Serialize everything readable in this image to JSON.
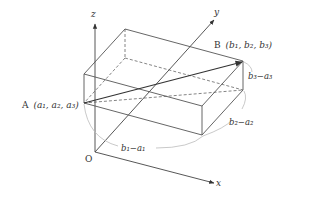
{
  "diagram": {
    "type": "3d-coordinate-box",
    "axes": {
      "x": {
        "label": "x"
      },
      "y": {
        "label": "y"
      },
      "z": {
        "label": "z"
      },
      "origin": {
        "label": "O"
      }
    },
    "points": {
      "A": {
        "name": "A",
        "coords": "(a₁, a₂, a₃)"
      },
      "B": {
        "name": "B",
        "coords": "(b₁, b₂, b₃)"
      }
    },
    "dimensions": {
      "dx": "b₁−a₁",
      "dy": "b₂−a₂",
      "dz": "b₃−a₃"
    },
    "colors": {
      "line": "#555555",
      "arc": "#bbbbbb",
      "text": "#333333"
    }
  }
}
